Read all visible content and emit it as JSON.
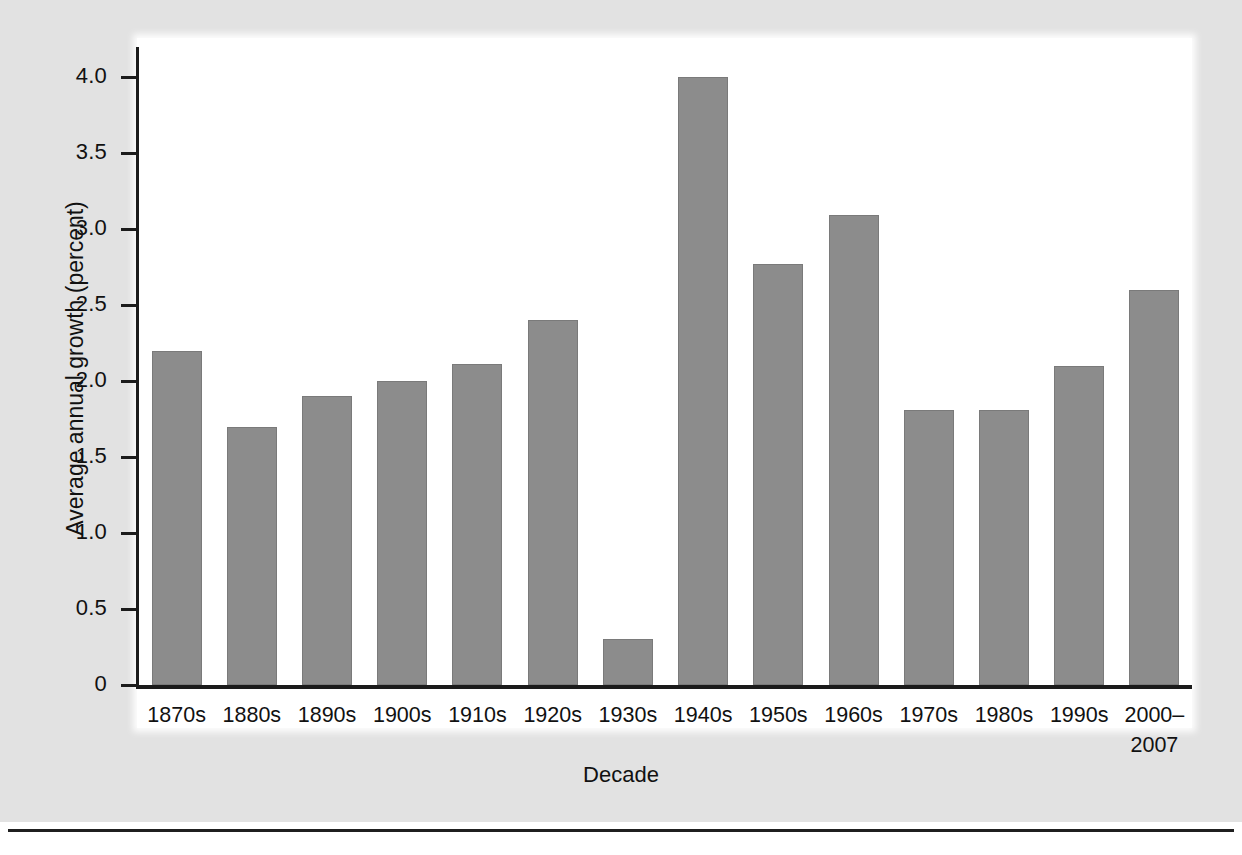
{
  "chart_data": {
    "type": "bar",
    "title": "",
    "xlabel": "Decade",
    "ylabel": "Average annual growth (percent)",
    "categories": [
      "1870s",
      "1880s",
      "1890s",
      "1900s",
      "1910s",
      "1920s",
      "1930s",
      "1940s",
      "1950s",
      "1960s",
      "1970s",
      "1980s",
      "1990s",
      "2000–\n2007"
    ],
    "values": [
      2.2,
      1.7,
      1.9,
      2.0,
      2.11,
      2.4,
      0.3,
      4.0,
      2.77,
      3.09,
      1.81,
      1.81,
      2.1,
      2.6
    ],
    "ylim": [
      0,
      4.2
    ],
    "yticks": [
      0,
      0.5,
      1.0,
      1.5,
      2.0,
      2.5,
      3.0,
      3.5,
      4.0
    ],
    "ytick_labels": [
      "0",
      "0.5",
      "1.0",
      "1.5",
      "2.0",
      "2.5",
      "3.0",
      "3.5",
      "4.0"
    ],
    "grid": false,
    "legend": false,
    "bar_color": "#8c8c8c",
    "bar_edge_color": "#7a7a7a",
    "axis_color": "#1b1b1b",
    "panel_background": "#e2e2e2",
    "plot_background": "#ffffff"
  },
  "axis": {
    "x_title": "Decade",
    "y_title": "Average annual growth (percent)"
  }
}
